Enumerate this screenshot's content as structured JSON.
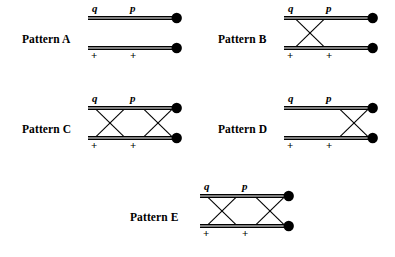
{
  "figure": {
    "background_color": "#ffffff",
    "stroke_color": "#000000",
    "canvas": {
      "width": 395,
      "height": 257
    }
  },
  "geometry": {
    "rail_left_x": 2,
    "rail_right_x": 86,
    "top_rail_y": 16,
    "bottom_rail_y": 46,
    "terminal_radius": 5.2,
    "rail_gap": 2.6,
    "label_top_y": 10,
    "label_bottom_y": 57
  },
  "symbols": {
    "top_left": "q",
    "top_right": "p",
    "bottom_left": "+",
    "bottom_right": "+"
  },
  "symbol_positions": {
    "top_left_x": 6,
    "top_right_x": 44,
    "bottom_left_x": 5,
    "bottom_right_x": 44
  },
  "patterns": [
    {
      "id": "a",
      "label": "Pattern A",
      "label_x": 22,
      "label_y": 32,
      "diagram_x": 86,
      "diagram_y": 0,
      "crossings": [],
      "crossing_count": 0,
      "description": "two straight parallel double-rails, no crossings"
    },
    {
      "id": "b",
      "label": "Pattern B",
      "label_x": 20,
      "label_y": 32,
      "diagram_x": 84,
      "diagram_y": 0,
      "crossings": [
        {
          "start_x": 14,
          "end_x": 42
        }
      ],
      "crossing_count": 1,
      "description": "single X crossing on the left"
    },
    {
      "id": "c",
      "label": "Pattern C",
      "label_x": 22,
      "label_y": 32,
      "diagram_x": 86,
      "diagram_y": 0,
      "crossings": [
        {
          "start_x": 10,
          "end_x": 38
        },
        {
          "start_x": 58,
          "end_x": 86
        }
      ],
      "crossing_count": 2,
      "description": "two X crossings, left and right"
    },
    {
      "id": "d",
      "label": "Pattern D",
      "label_x": 20,
      "label_y": 32,
      "diagram_x": 84,
      "diagram_y": 0,
      "crossings": [
        {
          "start_x": 58,
          "end_x": 86
        }
      ],
      "crossing_count": 1,
      "description": "single X crossing on the right"
    },
    {
      "id": "e",
      "label": "Pattern E",
      "label_x": 30,
      "label_y": 32,
      "diagram_x": 98,
      "diagram_y": 0,
      "crossings": [
        {
          "start_x": 10,
          "end_x": 38
        },
        {
          "start_x": 58,
          "end_x": 86
        }
      ],
      "crossing_count": 2,
      "description": "two X crossings, left and right"
    }
  ]
}
